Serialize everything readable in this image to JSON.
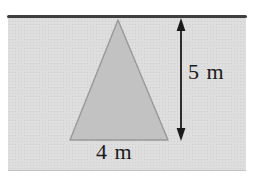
{
  "figure": {
    "type": "triangle-measurement-diagram",
    "labels": {
      "height": "5 m",
      "base": "4 m"
    },
    "measurements": {
      "height_value": 5,
      "base_value": 4,
      "unit": "m"
    },
    "colors": {
      "page_bg": "#ffffff",
      "panel_bg": "#dedede",
      "panel_texture_dot": "#cfcfcf",
      "top_rule": "#3f3f3f",
      "triangle_fill": "#c2c2c2",
      "triangle_stroke": "#999999",
      "arrow": "#1a1a1a",
      "text": "#1b1b1b"
    }
  }
}
